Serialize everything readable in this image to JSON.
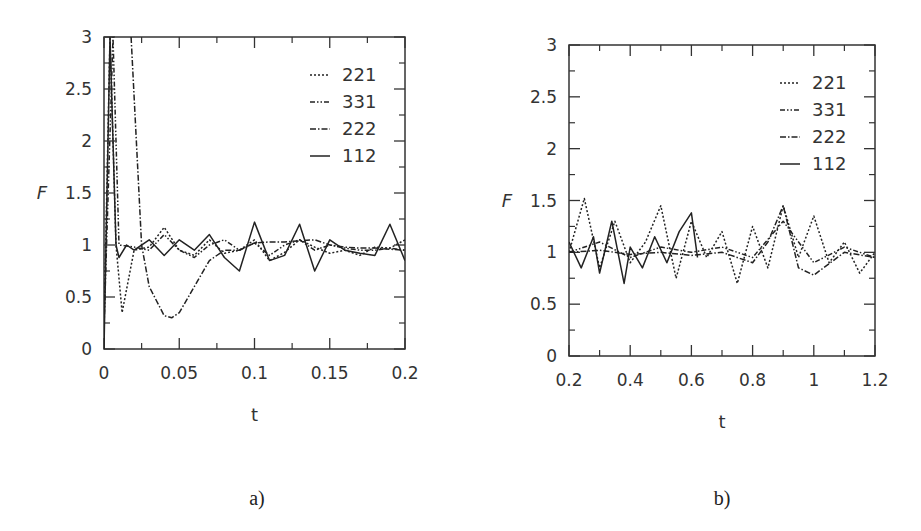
{
  "chart_data": [
    {
      "panel": "a)",
      "type": "line",
      "xlabel": "t",
      "ylabel": "F",
      "xlim": [
        0,
        0.2
      ],
      "ylim": [
        0,
        3
      ],
      "xticks": [
        "0",
        "0.05",
        "0.1",
        "0.15",
        "0.2"
      ],
      "yticks": [
        "0",
        "0.5",
        "1",
        "1.5",
        "2",
        "2.5",
        "3"
      ],
      "grid": false,
      "legend_position": "upper right",
      "legend": [
        "221",
        "331",
        "222",
        "112"
      ],
      "series": [
        {
          "name": "221",
          "style": "dotted",
          "x": [
            0,
            0.004,
            0.008,
            0.012,
            0.02,
            0.03,
            0.04,
            0.05,
            0.06,
            0.07,
            0.08,
            0.09,
            0.1,
            0.11,
            0.12,
            0.13,
            0.14,
            0.15,
            0.16,
            0.17,
            0.18,
            0.19,
            0.2
          ],
          "values": [
            0.2,
            3.0,
            1.0,
            0.35,
            0.95,
            0.98,
            1.17,
            0.95,
            0.9,
            1.05,
            0.92,
            0.95,
            1.05,
            0.85,
            0.93,
            1.05,
            0.98,
            0.92,
            0.95,
            0.9,
            0.98,
            0.97,
            1.05
          ]
        },
        {
          "name": "331",
          "style": "dash-dot-dot",
          "x": [
            0,
            0.006,
            0.01,
            0.02,
            0.03,
            0.04,
            0.05,
            0.06,
            0.07,
            0.08,
            0.09,
            0.1,
            0.11,
            0.12,
            0.13,
            0.14,
            0.15,
            0.16,
            0.17,
            0.18,
            0.19,
            0.2
          ],
          "values": [
            0.2,
            3.0,
            1.0,
            0.98,
            0.95,
            1.1,
            0.95,
            0.88,
            1.0,
            1.05,
            0.95,
            1.02,
            0.9,
            1.0,
            1.05,
            0.95,
            1.0,
            0.97,
            0.95,
            0.95,
            0.97,
            0.95
          ]
        },
        {
          "name": "222",
          "style": "dash-dot",
          "x": [
            0.018,
            0.025,
            0.03,
            0.04,
            0.045,
            0.05,
            0.06,
            0.07,
            0.08,
            0.09,
            0.1,
            0.11,
            0.12,
            0.13,
            0.14,
            0.15,
            0.16,
            0.17,
            0.18,
            0.19,
            0.2
          ],
          "values": [
            3.0,
            1.0,
            0.6,
            0.32,
            0.3,
            0.35,
            0.6,
            0.85,
            0.95,
            0.95,
            1.02,
            1.03,
            1.03,
            1.04,
            1.05,
            1.0,
            0.98,
            0.97,
            0.97,
            0.96,
            0.95
          ]
        },
        {
          "name": "112",
          "style": "solid",
          "x": [
            0,
            0.004,
            0.008,
            0.01,
            0.015,
            0.02,
            0.03,
            0.04,
            0.05,
            0.06,
            0.07,
            0.08,
            0.09,
            0.1,
            0.11,
            0.12,
            0.13,
            0.14,
            0.15,
            0.16,
            0.17,
            0.18,
            0.19,
            0.2
          ],
          "values": [
            0,
            3.0,
            1.0,
            0.88,
            1.0,
            0.95,
            1.05,
            0.9,
            1.05,
            0.95,
            1.1,
            0.88,
            0.75,
            1.22,
            0.85,
            0.9,
            1.2,
            0.75,
            1.05,
            0.95,
            0.92,
            0.9,
            1.2,
            0.85
          ]
        }
      ]
    },
    {
      "panel": "b)",
      "type": "line",
      "xlabel": "t",
      "ylabel": "F",
      "xlim": [
        0.2,
        1.2
      ],
      "ylim": [
        0,
        3
      ],
      "xticks": [
        "0.2",
        "0.4",
        "0.6",
        "0.8",
        "1",
        "1.2"
      ],
      "yticks": [
        "0",
        "0.5",
        "1",
        "1.5",
        "2",
        "2.5",
        "3"
      ],
      "grid": false,
      "legend_position": "upper right",
      "legend": [
        "221",
        "331",
        "222",
        "112"
      ],
      "series": [
        {
          "name": "221",
          "style": "dotted",
          "x": [
            0.2,
            0.25,
            0.3,
            0.35,
            0.4,
            0.45,
            0.5,
            0.55,
            0.6,
            0.65,
            0.7,
            0.75,
            0.8,
            0.85,
            0.9,
            0.95,
            1.0,
            1.05,
            1.1,
            1.15,
            1.2
          ],
          "values": [
            1.0,
            1.52,
            0.85,
            1.3,
            0.9,
            1.1,
            1.45,
            0.75,
            1.3,
            0.95,
            1.2,
            0.7,
            1.25,
            0.85,
            1.45,
            0.95,
            1.35,
            0.9,
            1.1,
            0.8,
            1.0
          ]
        },
        {
          "name": "331",
          "style": "dash-dot-dot",
          "x": [
            0.2,
            0.3,
            0.4,
            0.5,
            0.6,
            0.7,
            0.8,
            0.9,
            1.0,
            1.1,
            1.2
          ],
          "values": [
            1.0,
            1.1,
            0.95,
            1.05,
            1.0,
            1.05,
            0.95,
            1.3,
            0.9,
            1.05,
            0.95
          ]
        },
        {
          "name": "222",
          "style": "dash-dot",
          "x": [
            0.2,
            0.3,
            0.4,
            0.5,
            0.6,
            0.7,
            0.8,
            0.85,
            0.9,
            0.95,
            1.0,
            1.1,
            1.2
          ],
          "values": [
            1.0,
            1.02,
            0.98,
            1.0,
            0.97,
            1.0,
            0.9,
            1.1,
            1.45,
            0.85,
            0.78,
            1.0,
            0.95
          ]
        },
        {
          "name": "112",
          "style": "solid",
          "x": [
            0.2,
            0.24,
            0.28,
            0.3,
            0.34,
            0.38,
            0.4,
            0.44,
            0.48,
            0.52,
            0.56,
            0.6,
            0.62
          ],
          "values": [
            1.1,
            0.85,
            1.15,
            0.8,
            1.3,
            0.7,
            1.05,
            0.85,
            1.15,
            0.9,
            1.2,
            1.38,
            0.95
          ]
        }
      ]
    }
  ],
  "captions": {
    "a": "a)",
    "b": "b)"
  }
}
